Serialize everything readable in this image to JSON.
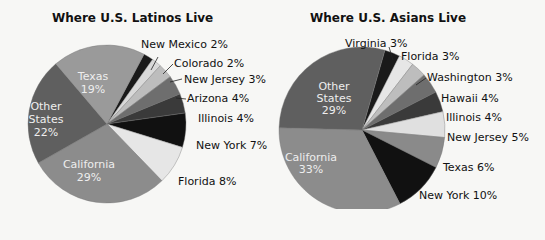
{
  "chart_data": [
    {
      "type": "pie",
      "title": "Where U.S. Latinos Live",
      "slices": [
        {
          "label": "New Mexico",
          "value": 2,
          "color": "#1a1a1a"
        },
        {
          "label": "Colorado",
          "value": 2,
          "color": "#d9d9d9"
        },
        {
          "label": "New Jersey",
          "value": 3,
          "color": "#bdbdbd"
        },
        {
          "label": "Arizona",
          "value": 4,
          "color": "#6e6e6e"
        },
        {
          "label": "Illinois",
          "value": 4,
          "color": "#3a3a3a"
        },
        {
          "label": "New York",
          "value": 7,
          "color": "#111111"
        },
        {
          "label": "Florida",
          "value": 8,
          "color": "#e6e6e6"
        },
        {
          "label": "California",
          "value": 29,
          "color": "#8c8c8c"
        },
        {
          "label": "Other States",
          "value": 22,
          "color": "#5f5f5f"
        },
        {
          "label": "Texas",
          "value": 19,
          "color": "#9a9a9a"
        }
      ]
    },
    {
      "type": "pie",
      "title": "Where U.S. Asians Live",
      "slices": [
        {
          "label": "Virginia",
          "value": 3,
          "color": "#1a1a1a"
        },
        {
          "label": "Florida",
          "value": 3,
          "color": "#e6e6e6"
        },
        {
          "label": "Washington",
          "value": 3,
          "color": "#bdbdbd"
        },
        {
          "label": "Hawaii",
          "value": 4,
          "color": "#6e6e6e"
        },
        {
          "label": "Illinois",
          "value": 4,
          "color": "#3a3a3a"
        },
        {
          "label": "New Jersey",
          "value": 5,
          "color": "#e0e0e0"
        },
        {
          "label": "Texas",
          "value": 6,
          "color": "#8a8a8a"
        },
        {
          "label": "New York",
          "value": 10,
          "color": "#111111"
        },
        {
          "label": "California",
          "value": 33,
          "color": "#8c8c8c"
        },
        {
          "label": "Other States",
          "value": 29,
          "color": "#5f5f5f"
        }
      ]
    }
  ],
  "left": {
    "title": "Where U.S. Latinos Live",
    "labels": {
      "new_mexico": "New Mexico 2%",
      "colorado": "Colorado 2%",
      "new_jersey": "New Jersey 3%",
      "arizona": "Arizona 4%",
      "illinois": "Illinois 4%",
      "new_york": "New York 7%",
      "florida": "Florida 8%",
      "texas_name": "Texas",
      "texas_pct": "19%",
      "other_1": "Other",
      "other_2": "States",
      "other_pct": "22%",
      "california_name": "California",
      "california_pct": "29%"
    }
  },
  "right": {
    "title": "Where U.S. Asians Live",
    "labels": {
      "virginia": "Virginia 3%",
      "florida": "Florida 3%",
      "washington": "Washington 3%",
      "hawaii": "Hawaii 4%",
      "illinois": "Illinois 4%",
      "new_jersey": "New Jersey 5%",
      "texas": "Texas 6%",
      "new_york": "New York 10%",
      "other_1": "Other",
      "other_2": "States",
      "other_pct": "29%",
      "california_name": "California",
      "california_pct": "33%"
    }
  }
}
